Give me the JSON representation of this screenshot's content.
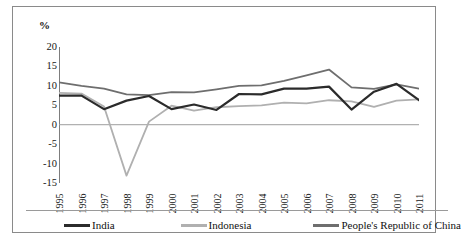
{
  "axis_label": "%",
  "yticks": [
    "20",
    "15",
    "10",
    "5",
    "0",
    "-5",
    "-10",
    "-15"
  ],
  "legend": {
    "items": [
      {
        "label": "India",
        "color": "#2b2b2b"
      },
      {
        "label": "Indonesia",
        "color": "#b0b0b0"
      },
      {
        "label": "People's Republic of China",
        "color": "#6e6e6e"
      }
    ]
  },
  "chart_data": {
    "type": "line",
    "title": "",
    "subtitle": "",
    "xlabel": "",
    "ylabel": "%",
    "ylim": [
      -15,
      20
    ],
    "yticks": [
      -15,
      -10,
      -5,
      0,
      5,
      10,
      15,
      20
    ],
    "grid": false,
    "zero_line": true,
    "legend_position": "bottom",
    "categories": [
      "1995",
      "1996",
      "1997",
      "1998",
      "1999",
      "2000",
      "2001",
      "2002",
      "2003",
      "2004",
      "2005",
      "2006",
      "2007",
      "2008",
      "2009",
      "2010",
      "2011"
    ],
    "series": [
      {
        "name": "India",
        "color": "#2b2b2b",
        "values": [
          7.5,
          7.5,
          4.0,
          6.2,
          7.4,
          4.0,
          5.2,
          3.8,
          7.9,
          7.8,
          9.3,
          9.3,
          9.8,
          3.9,
          8.5,
          10.5,
          6.3
        ]
      },
      {
        "name": "Indonesia",
        "color": "#b0b0b0",
        "values": [
          8.2,
          8.0,
          4.7,
          -13.1,
          0.8,
          4.9,
          3.6,
          4.5,
          4.8,
          5.0,
          5.7,
          5.5,
          6.3,
          6.0,
          4.6,
          6.2,
          6.5
        ]
      },
      {
        "name": "People's Republic of China",
        "color": "#6e6e6e",
        "values": [
          10.9,
          10.0,
          9.3,
          7.8,
          7.6,
          8.4,
          8.3,
          9.1,
          10.0,
          10.1,
          11.3,
          12.7,
          14.2,
          9.6,
          9.2,
          10.4,
          9.3
        ]
      }
    ]
  }
}
